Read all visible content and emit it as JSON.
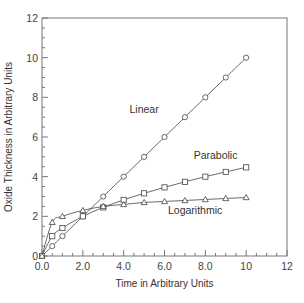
{
  "chart_data": {
    "type": "line",
    "title": "",
    "xlabel": "Time in Arbitrary Units",
    "ylabel": "Oxide Thickness in Arbitrary Units",
    "xlim": [
      0,
      12
    ],
    "ylim": [
      0,
      12
    ],
    "grid": false,
    "legend": "inline labels",
    "x_ticks": [
      "0.0",
      "2.0",
      "4.0",
      "6.0",
      "8.0",
      "10",
      "12"
    ],
    "y_ticks": [
      "0",
      "2",
      "4",
      "6",
      "8",
      "10",
      "12"
    ],
    "series": [
      {
        "name": "Linear",
        "marker": "circle",
        "x": [
          0,
          0.5,
          1,
          2,
          3,
          4,
          5,
          6,
          7,
          8,
          9,
          10
        ],
        "values": [
          0,
          0.5,
          1.0,
          2.0,
          3.0,
          4.0,
          5.0,
          6.0,
          7.0,
          8.0,
          9.0,
          10.0
        ],
        "label_pos": [
          5.0,
          7.2
        ]
      },
      {
        "name": "Parabolic",
        "marker": "square",
        "x": [
          0,
          0.5,
          1,
          2,
          3,
          4,
          5,
          6,
          7,
          8,
          9,
          10
        ],
        "values": [
          0,
          1.0,
          1.41,
          2.0,
          2.45,
          2.83,
          3.16,
          3.46,
          3.74,
          4.0,
          4.24,
          4.47
        ],
        "label_pos": [
          8.5,
          4.9
        ]
      },
      {
        "name": "Logarithmic",
        "marker": "triangle",
        "x": [
          0,
          0.5,
          1,
          2,
          3,
          4,
          5,
          6,
          7,
          8,
          9,
          10
        ],
        "values": [
          0,
          1.7,
          2.0,
          2.3,
          2.5,
          2.6,
          2.7,
          2.75,
          2.8,
          2.85,
          2.9,
          2.95
        ],
        "label_pos": [
          7.5,
          2.1
        ]
      }
    ]
  },
  "colors": {
    "frame": "#777777",
    "line": "#444444",
    "text": "#333333",
    "background": "#ffffff"
  }
}
